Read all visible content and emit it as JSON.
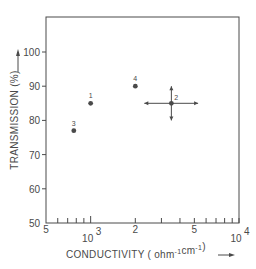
{
  "chart_data": {
    "type": "scatter",
    "title": "",
    "xlabel": "CONDUCTIVITY ( ohm-1 cm-1 )",
    "xlabel_parts": {
      "main": "CONDUCTIVITY ( ohm",
      "sup1": "-1",
      "mid": "cm",
      "sup2": "-1",
      "end": ")"
    },
    "ylabel": "TRANSMISSION (%)",
    "x_scale": "log",
    "xlim": [
      500,
      10000
    ],
    "ylim": [
      50,
      108
    ],
    "grid": false,
    "legend": "none",
    "y_ticks": [
      {
        "value": 50,
        "label": "50"
      },
      {
        "value": 60,
        "label": "60"
      },
      {
        "value": 70,
        "label": "70"
      },
      {
        "value": 80,
        "label": "80"
      },
      {
        "value": 90,
        "label": "90"
      },
      {
        "value": 100,
        "label": "100"
      }
    ],
    "x_tick_labels": [
      {
        "value": 500,
        "label": "5"
      },
      {
        "value": 1000,
        "label": "10",
        "sup": "3"
      },
      {
        "value": 2000,
        "label": "2"
      },
      {
        "value": 5000,
        "label": "5"
      },
      {
        "value": 10000,
        "label": "10",
        "sup": "4"
      }
    ],
    "x_minor_ticks": [
      600,
      700,
      800,
      900,
      1000,
      2000,
      3000,
      4000,
      5000,
      6000,
      7000,
      8000,
      9000,
      10000
    ],
    "points": [
      {
        "label": "1",
        "x": 1000,
        "y": 85
      },
      {
        "label": "2",
        "x": 3500,
        "y": 85,
        "error_bars": {
          "x_range": [
            2300,
            5300
          ],
          "y_range": [
            80,
            90
          ]
        }
      },
      {
        "label": "3",
        "x": 770,
        "y": 77
      },
      {
        "label": "4",
        "x": 2000,
        "y": 90
      }
    ]
  },
  "colors": {
    "ink": "#4a4a4a",
    "background": "#ffffff"
  }
}
